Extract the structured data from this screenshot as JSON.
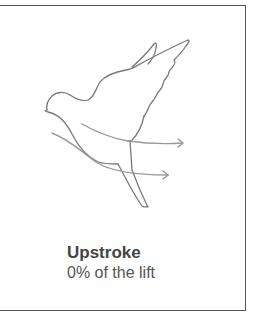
{
  "panel": {
    "title": "Upstroke",
    "subtitle": "0% of the lift"
  },
  "illustration": {
    "subject": "bird-upstroke-diagram",
    "stroke_color": "#777777",
    "arrow_color": "#999999"
  }
}
